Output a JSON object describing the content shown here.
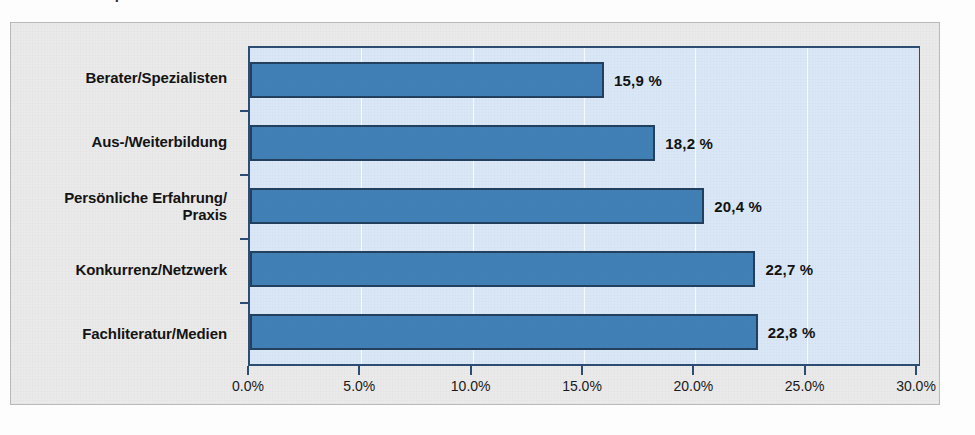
{
  "title_fragment": "Informationsquellen",
  "chart_data": {
    "type": "bar",
    "orientation": "horizontal",
    "title": "",
    "xlabel": "",
    "ylabel": "",
    "categories": [
      "Berater/Spezialisten",
      "Aus-/Weiterbildung",
      "Persönliche Erfahrung/\nPraxis",
      "Konkurrenz/Netzwerk",
      "Fachliteratur/Medien"
    ],
    "values": [
      15.9,
      18.2,
      20.4,
      22.7,
      22.8
    ],
    "value_labels": [
      "15,9 %",
      "18,2 %",
      "20,4 %",
      "22,7 %",
      "22,8 %"
    ],
    "xlim": [
      0,
      30
    ],
    "xticks": [
      0,
      5,
      10,
      15,
      20,
      25,
      30
    ],
    "xtick_labels": [
      "0.0%",
      "5.0%",
      "10.0%",
      "15.0%",
      "20.0%",
      "25.0%",
      "30.0%"
    ],
    "grid": true,
    "legend": false,
    "colors": {
      "bar_fill": "#4180b6",
      "bar_border": "#23405f",
      "plot_background": "#d9e7f6",
      "panel_background": "#eaeaea",
      "gridline": "#ffffff",
      "axis": "#2d4d72",
      "text": "#141414"
    }
  }
}
